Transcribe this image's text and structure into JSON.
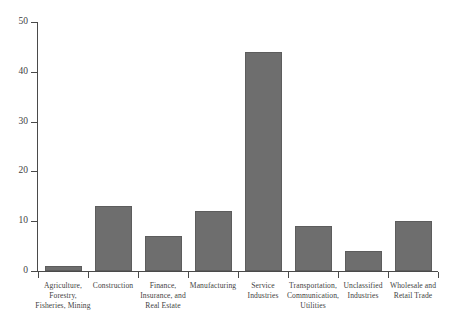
{
  "chart_data": {
    "type": "bar",
    "title": "",
    "subtitle": "",
    "xlabel": "",
    "ylabel": "",
    "ylim": [
      0,
      50
    ],
    "yticks": [
      0,
      10,
      20,
      30,
      40,
      50
    ],
    "grid": false,
    "legend": "none",
    "orientation": "vertical",
    "bar_color": "#6e6e6e",
    "axis_color": "#4a4a4a",
    "background": "#ffffff",
    "categories": [
      "Agriculture, Forestry, Fisheries, Mining",
      "Construction",
      "Finance, Insurance, and Real Estate",
      "Manufacturing",
      "Service Industries",
      "Transportation, Communication, Utilities",
      "Unclassified Industries",
      "Wholesale and Retail Trade"
    ],
    "category_lines": [
      [
        "Agriculture,",
        "Forestry,",
        "Fisheries, Mining"
      ],
      [
        "Construction"
      ],
      [
        "Finance,",
        "Insurance, and",
        "Real Estate"
      ],
      [
        "Manufacturing"
      ],
      [
        "Service",
        "Industries"
      ],
      [
        "Transportation,",
        "Communication,",
        "Utilities"
      ],
      [
        "Unclassified",
        "Industries"
      ],
      [
        "Wholesale and",
        "Retail Trade"
      ]
    ],
    "values": [
      1,
      13,
      7,
      12,
      44,
      9,
      4,
      10
    ]
  }
}
